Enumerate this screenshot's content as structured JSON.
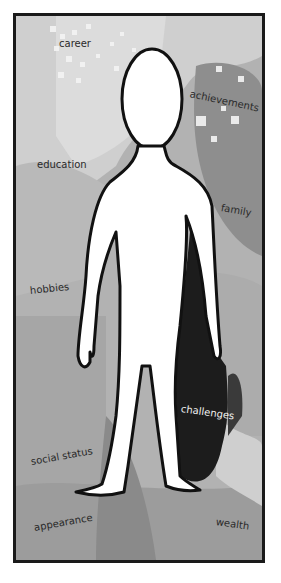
{
  "illustration": {
    "subject": "white human silhouette standing in a framed painted background",
    "labels": [
      {
        "id": "career",
        "text": "career"
      },
      {
        "id": "achievements",
        "text": "achievements"
      },
      {
        "id": "education",
        "text": "education"
      },
      {
        "id": "family",
        "text": "family"
      },
      {
        "id": "hobbies",
        "text": "hobbies"
      },
      {
        "id": "challenges",
        "text": "challenges"
      },
      {
        "id": "social_status",
        "text": "social status"
      },
      {
        "id": "appearance",
        "text": "appearance"
      },
      {
        "id": "wealth",
        "text": "wealth"
      }
    ],
    "colors": {
      "frame": "#1a1a1a",
      "background_light": "#d2d2d2",
      "background_mid": "#a8a8a8",
      "background_dark": "#8c8c8c",
      "shadow": "#1c1c1c",
      "figure": "#ffffff"
    }
  }
}
